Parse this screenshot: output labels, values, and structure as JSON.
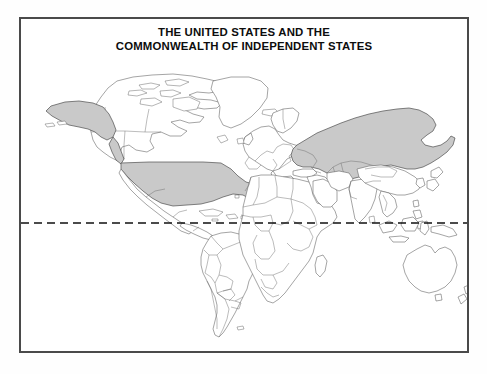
{
  "document": {
    "type": "thematic-world-map",
    "background_color": "#ffffff"
  },
  "map": {
    "title_line_1": "THE UNITED STATES AND THE",
    "title_line_2": "COMMONWEALTH OF INDEPENDENT STATES",
    "frame_color": "#4a4a4a",
    "projection_note": "world outline with national borders",
    "ocean_color": "#ffffff",
    "land_color": "#ffffff",
    "border_color": "#555555",
    "highlight_color": "#c9c9c9",
    "highlight_border_color": "#4d4d4d",
    "equator": {
      "label": "equator",
      "style": "dashed",
      "color": "#111111"
    },
    "highlighted_regions": [
      "United States of America",
      "Alaska",
      "Commonwealth of Independent States"
    ],
    "unshaded_regions": [
      "Canada",
      "Greenland",
      "Mexico",
      "South America",
      "Africa",
      "Europe",
      "China",
      "India",
      "Australia",
      "New Zealand",
      "Indonesia",
      "Japan"
    ]
  }
}
